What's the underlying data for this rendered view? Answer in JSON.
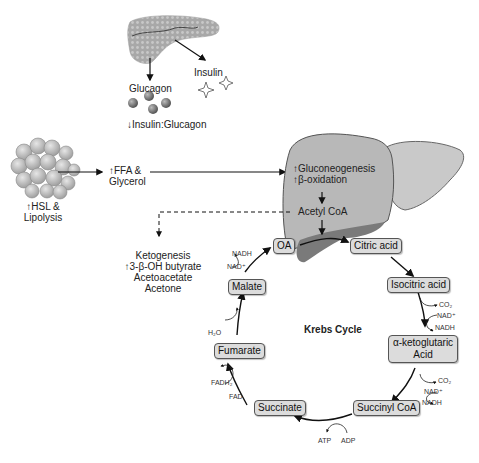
{
  "pancreas": {
    "glucagon_label": "Glucagon",
    "insulin_label": "Insulin",
    "ratio_label": "↓Insulin:Glucagon"
  },
  "adipose": {
    "label_line1": "↑HSL &",
    "label_line2": "Lipolysis",
    "output_line1": "↑FFA &",
    "output_line2": "Glycerol"
  },
  "liver": {
    "line1": "↑Gluconeogenesis",
    "line2": "↑β-oxidation",
    "acetyl_coa": "Acetyl CoA"
  },
  "ketogenesis": {
    "title": "Ketogenesis",
    "items": [
      "↑3-β-OH butyrate",
      "Acetoacetate",
      "Acetone"
    ]
  },
  "krebs": {
    "title": "Krebs Cycle",
    "nodes": {
      "oa": "OA",
      "citric": "Citric acid",
      "isocitric": "Isocitric acid",
      "akg_line1": "α-ketoglutaric",
      "akg_line2": "Acid",
      "succinyl": "Succinyl CoA",
      "succinate": "Succinate",
      "fumarate": "Fumarate",
      "malate": "Malate"
    },
    "cofactors": {
      "iso_co2": "CO₂",
      "iso_nad": "NAD⁺",
      "iso_nadh": "NADH",
      "akg_co2": "CO₂",
      "akg_nad": "NAD⁺",
      "akg_nadh": "NADH",
      "atp": "ATP",
      "adp": "ADP",
      "fadh2": "FADH₂",
      "fad": "FAD",
      "h2o": "H₂O",
      "mal_nadh": "NADH",
      "mal_nad": "NAD⁺"
    }
  }
}
